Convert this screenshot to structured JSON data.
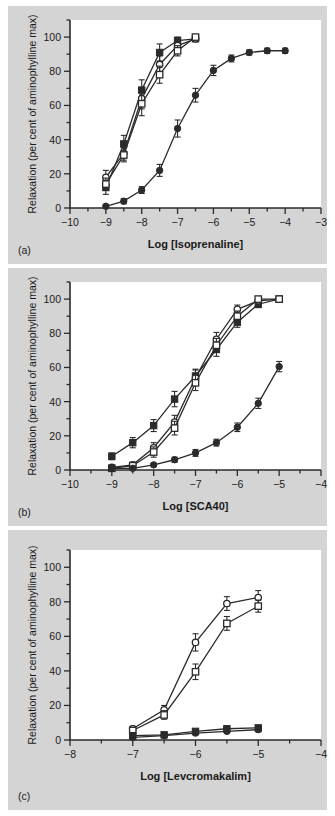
{
  "figure": {
    "background": "#d4d4d4",
    "plot_background": "#ffffff",
    "ink": "#2b2b2b",
    "ylabel": "Relaxation (per cent of aminophylline max)",
    "panel_labels": [
      "(a)",
      "(b)",
      "(c)"
    ]
  },
  "chart_data": [
    {
      "type": "line",
      "panel": "(a)",
      "title": "",
      "xlabel": "Log [Isoprenaline]",
      "ylabel": "Relaxation (per cent of aminophylline max)",
      "xlim": [
        -10,
        -3
      ],
      "ylim": [
        0,
        110
      ],
      "xticks": [
        -10,
        -9,
        -8,
        -7,
        -6,
        -5,
        -4,
        -3
      ],
      "xtick_labels": [
        "-10",
        "-9",
        "-8",
        "-7",
        "-6",
        "-5",
        "-4",
        "-3"
      ],
      "yticks": [
        0,
        20,
        40,
        60,
        80,
        100
      ],
      "ytick_labels": [
        "0",
        "20",
        "40",
        "60",
        "80",
        "100"
      ],
      "minor_xticks": [
        -9.5,
        -8.5,
        -7.5,
        -6.5,
        -5.5,
        -4.5,
        -3.5
      ],
      "minor_yticks": [
        10,
        30,
        50,
        70,
        90,
        110
      ],
      "grid": false,
      "legend": "none",
      "series": [
        {
          "name": "filled-square",
          "marker": "filled-square",
          "x": [
            -9,
            -8.5,
            -8,
            -7.5,
            -7,
            -6.5
          ],
          "values": [
            12,
            37.5,
            69,
            91,
            98,
            99
          ],
          "errors": [
            4,
            5,
            6,
            5,
            2,
            1.5
          ]
        },
        {
          "name": "open-circle",
          "marker": "open-circle",
          "x": [
            -9,
            -8.5,
            -8,
            -7.5,
            -7,
            -6.5
          ],
          "values": [
            18,
            32,
            64,
            84,
            95,
            99
          ],
          "errors": [
            4,
            4,
            6,
            5,
            2.5,
            1.5
          ]
        },
        {
          "name": "open-square",
          "marker": "open-square",
          "x": [
            -9,
            -8.5,
            -8,
            -7.5,
            -7,
            -6.5
          ],
          "values": [
            14,
            31,
            61,
            78,
            92,
            100
          ],
          "errors": [
            3.5,
            4,
            7,
            5,
            3,
            1.5
          ]
        },
        {
          "name": "filled-circle",
          "marker": "filled-circle",
          "x": [
            -9,
            -8.5,
            -8,
            -7.5,
            -7,
            -6.5,
            -6,
            -5.5,
            -5,
            -4.5,
            -4
          ],
          "values": [
            1,
            4,
            10.5,
            22,
            46.5,
            66,
            80.5,
            87.5,
            91,
            92,
            92
          ],
          "errors": [
            1,
            1.5,
            2,
            3.5,
            5,
            4,
            3,
            2,
            1.5,
            1.5,
            1.5
          ]
        }
      ]
    },
    {
      "type": "line",
      "panel": "(b)",
      "title": "",
      "xlabel": "Log [SCA40]",
      "ylabel": "Relaxation (per cent of aminophylline max)",
      "xlim": [
        -10,
        -4
      ],
      "ylim": [
        0,
        110
      ],
      "xticks": [
        -10,
        -9,
        -8,
        -7,
        -6,
        -5,
        -4
      ],
      "xtick_labels": [
        "-10",
        "-9",
        "-8",
        "-7",
        "-6",
        "-5",
        "-4"
      ],
      "yticks": [
        0,
        20,
        40,
        60,
        80,
        100
      ],
      "ytick_labels": [
        "0",
        "20",
        "40",
        "60",
        "80",
        "100"
      ],
      "minor_xticks": [
        -9.5,
        -8.5,
        -7.5,
        -6.5,
        -5.5,
        -4.5
      ],
      "minor_yticks": [
        10,
        30,
        50,
        70,
        90,
        110
      ],
      "grid": false,
      "legend": "none",
      "series": [
        {
          "name": "filled-square",
          "marker": "filled-square",
          "x": [
            -9,
            -8.5,
            -8,
            -7.5,
            -7,
            -6.5,
            -6,
            -5.5,
            -5
          ],
          "values": [
            8,
            16,
            26,
            41.5,
            55,
            70.5,
            86.5,
            97,
            100
          ],
          "errors": [
            2,
            3,
            3.5,
            4.5,
            4,
            4,
            3,
            2,
            1
          ]
        },
        {
          "name": "open-circle",
          "marker": "open-circle",
          "x": [
            -9,
            -8.5,
            -8,
            -7.5,
            -7,
            -6.5,
            -6,
            -5.5,
            -5
          ],
          "values": [
            1.5,
            3,
            13,
            28,
            54,
            76.5,
            94,
            99,
            100
          ],
          "errors": [
            1,
            1.5,
            3,
            4,
            4.5,
            4,
            2.5,
            1.5,
            1
          ]
        },
        {
          "name": "open-square",
          "marker": "open-square",
          "x": [
            -9,
            -8.5,
            -8,
            -7.5,
            -7,
            -6.5,
            -6,
            -5.5,
            -5
          ],
          "values": [
            1,
            2.5,
            10.5,
            24.5,
            51,
            73,
            90,
            100,
            100
          ],
          "errors": [
            1,
            1.5,
            3,
            4,
            4.5,
            4,
            3,
            1.5,
            1
          ]
        },
        {
          "name": "filled-circle",
          "marker": "filled-circle",
          "x": [
            -9,
            -8.5,
            -8,
            -7.5,
            -7,
            -6.5,
            -6,
            -5.5,
            -5
          ],
          "values": [
            1,
            1,
            3,
            6,
            10,
            16,
            25,
            39,
            60.5
          ],
          "errors": [
            0.8,
            0.8,
            1,
            1.5,
            2,
            2,
            2.5,
            3,
            3
          ]
        }
      ]
    },
    {
      "type": "line",
      "panel": "(c)",
      "title": "",
      "xlabel": "Log [Levcromakalim]",
      "ylabel": "Relaxation (per cent of aminophylline max)",
      "xlim": [
        -8,
        -4
      ],
      "ylim": [
        0,
        110
      ],
      "xticks": [
        -8,
        -7,
        -6,
        -5,
        -4
      ],
      "xtick_labels": [
        "-8",
        "-7",
        "-6",
        "-5",
        "-4"
      ],
      "yticks": [
        0,
        20,
        40,
        60,
        80,
        100
      ],
      "ytick_labels": [
        "0",
        "20",
        "40",
        "60",
        "80",
        "100"
      ],
      "minor_xticks": [
        -7.5,
        -6.5,
        -5.5,
        -4.5
      ],
      "minor_yticks": [
        10,
        30,
        50,
        70,
        90,
        110
      ],
      "grid": false,
      "legend": "none",
      "series": [
        {
          "name": "open-circle",
          "marker": "open-circle",
          "x": [
            -7,
            -6.5,
            -6,
            -5.5,
            -5
          ],
          "values": [
            6.5,
            17.5,
            56.5,
            79,
            82.5
          ],
          "errors": [
            1.5,
            2.5,
            5,
            4,
            4
          ]
        },
        {
          "name": "open-square",
          "marker": "open-square",
          "x": [
            -7,
            -6.5,
            -6,
            -5.5,
            -5
          ],
          "values": [
            5.5,
            14.5,
            39.5,
            67.5,
            77.5
          ],
          "errors": [
            1.5,
            2.5,
            4.5,
            4,
            3.5
          ]
        },
        {
          "name": "filled-square",
          "marker": "filled-square",
          "x": [
            -7,
            -6.5,
            -6,
            -5.5,
            -5
          ],
          "values": [
            2.5,
            3,
            5,
            6.5,
            7
          ],
          "errors": [
            0.8,
            0.8,
            1,
            1.2,
            1.5
          ]
        },
        {
          "name": "filled-circle",
          "marker": "filled-circle",
          "x": [
            -7,
            -6.5,
            -6,
            -5.5,
            -5
          ],
          "values": [
            1.5,
            2.5,
            4,
            5,
            6
          ],
          "errors": [
            0.8,
            0.8,
            1,
            1,
            1.2
          ]
        }
      ]
    }
  ]
}
